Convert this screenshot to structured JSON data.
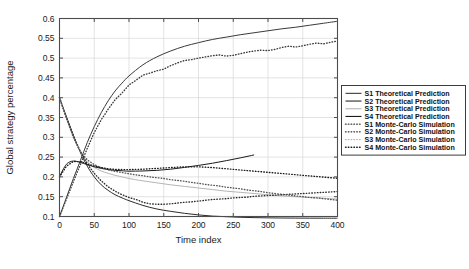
{
  "chart_data": {
    "type": "line",
    "title": "",
    "xlabel": "Time index",
    "ylabel": "Global strategy percentage",
    "xlim": [
      0,
      400
    ],
    "ylim": [
      0.1,
      0.6
    ],
    "xticks": [
      0,
      50,
      100,
      150,
      200,
      250,
      300,
      350,
      400
    ],
    "xtick_labels": [
      "0",
      "50",
      "100",
      "150",
      "200",
      "250",
      "300",
      "350",
      "400"
    ],
    "yticks": [
      0.1,
      0.15,
      0.2,
      0.25,
      0.3,
      0.35,
      0.4,
      0.45,
      0.5,
      0.55,
      0.6
    ],
    "ytick_labels": [
      "0.1",
      "0.15",
      "0.2",
      "0.25",
      "0.3",
      "0.35",
      "0.4",
      "0.45",
      "0.5",
      "0.55",
      "0.6"
    ],
    "grid": true,
    "legend_position": "right-outside",
    "colors": {
      "s1": "#3a3a3a",
      "s2": "#2b2b2b",
      "s3": "#b5b5b5",
      "s4": "#1a1a1a",
      "grid": "#d0d0d0",
      "axis": "#4d4d4d",
      "background": "#ffffff"
    },
    "series": [
      {
        "name": "S1 Theoretical Prediction",
        "style": "solid",
        "color": "#3a3a3a",
        "x": [
          0,
          10,
          20,
          30,
          40,
          50,
          60,
          70,
          80,
          90,
          100,
          120,
          140,
          160,
          180,
          200,
          220,
          240,
          260,
          280,
          300,
          320,
          340,
          360,
          380,
          400
        ],
        "y": [
          0.1,
          0.148,
          0.196,
          0.241,
          0.287,
          0.327,
          0.362,
          0.392,
          0.417,
          0.437,
          0.455,
          0.483,
          0.503,
          0.518,
          0.53,
          0.539,
          0.547,
          0.553,
          0.559,
          0.564,
          0.569,
          0.574,
          0.578,
          0.583,
          0.588,
          0.593
        ]
      },
      {
        "name": "S2 Theoretical Prediction",
        "style": "solid",
        "color": "#2b2b2b",
        "x": [
          0,
          10,
          20,
          30,
          40,
          50,
          60,
          70,
          80,
          90,
          100,
          120,
          140,
          160,
          180,
          200,
          220,
          240,
          260,
          280,
          300,
          320,
          340,
          360,
          380,
          400
        ],
        "y": [
          0.4,
          0.352,
          0.305,
          0.262,
          0.227,
          0.2,
          0.18,
          0.166,
          0.155,
          0.147,
          0.14,
          0.128,
          0.119,
          0.113,
          0.108,
          0.104,
          0.101,
          0.0995,
          0.098,
          0.0972,
          0.0966,
          0.0962,
          0.096,
          0.0958,
          0.0957,
          0.0956
        ]
      },
      {
        "name": "S3 Theoretical Prediction",
        "style": "solid",
        "color": "#b5b5b5",
        "x": [
          0,
          10,
          20,
          30,
          40,
          50,
          60,
          70,
          80,
          90,
          100,
          120,
          140,
          160,
          180,
          200,
          220,
          240,
          260,
          280,
          300,
          320,
          340,
          360,
          380,
          400
        ],
        "y": [
          0.4,
          0.347,
          0.3,
          0.262,
          0.238,
          0.224,
          0.215,
          0.209,
          0.204,
          0.2,
          0.196,
          0.19,
          0.185,
          0.18,
          0.176,
          0.172,
          0.168,
          0.164,
          0.161,
          0.158,
          0.155,
          0.152,
          0.15,
          0.148,
          0.146,
          0.144
        ]
      },
      {
        "name": "S4 Theoretical Prediction",
        "style": "solid",
        "color": "#1a1a1a",
        "x": [
          0,
          5,
          10,
          15,
          20,
          25,
          30,
          40,
          50,
          60,
          70,
          80,
          90,
          100,
          120,
          140,
          160,
          180,
          200,
          220,
          240,
          260,
          280
        ],
        "y": [
          0.2,
          0.218,
          0.232,
          0.238,
          0.24,
          0.239,
          0.2365,
          0.231,
          0.2255,
          0.2215,
          0.2185,
          0.2165,
          0.2155,
          0.2145,
          0.215,
          0.2165,
          0.2195,
          0.224,
          0.229,
          0.2345,
          0.241,
          0.248,
          0.2555
        ]
      },
      {
        "name": "S1 Monte-Carlo Simulation",
        "style": "dotted",
        "color": "#3a3a3a",
        "x": [
          0,
          10,
          20,
          30,
          40,
          50,
          60,
          70,
          80,
          90,
          100,
          110,
          120,
          130,
          140,
          150,
          160,
          170,
          180,
          190,
          200,
          210,
          220,
          230,
          240,
          250,
          260,
          270,
          280,
          290,
          300,
          310,
          320,
          330,
          340,
          350,
          360,
          370,
          380,
          390,
          400
        ],
        "y": [
          0.1,
          0.144,
          0.188,
          0.231,
          0.272,
          0.312,
          0.344,
          0.371,
          0.395,
          0.412,
          0.432,
          0.444,
          0.457,
          0.462,
          0.468,
          0.472,
          0.481,
          0.488,
          0.494,
          0.496,
          0.5,
          0.503,
          0.506,
          0.508,
          0.505,
          0.507,
          0.511,
          0.515,
          0.518,
          0.52,
          0.519,
          0.522,
          0.527,
          0.53,
          0.528,
          0.531,
          0.535,
          0.538,
          0.536,
          0.54,
          0.543
        ]
      },
      {
        "name": "S2 Monte-Carlo Simulation",
        "style": "dotted",
        "color": "#2b2b2b",
        "x": [
          0,
          10,
          20,
          30,
          40,
          50,
          60,
          70,
          80,
          90,
          100,
          110,
          120,
          130,
          140,
          150,
          160,
          170,
          180,
          190,
          200,
          210,
          220,
          230,
          240,
          250,
          260,
          270,
          280,
          290,
          300,
          310,
          320,
          330,
          340,
          350,
          360,
          370,
          380,
          390,
          400
        ],
        "y": [
          0.4,
          0.35,
          0.304,
          0.264,
          0.233,
          0.209,
          0.19,
          0.175,
          0.164,
          0.155,
          0.148,
          0.143,
          0.136,
          0.132,
          0.131,
          0.131,
          0.132,
          0.134,
          0.136,
          0.137,
          0.139,
          0.141,
          0.143,
          0.144,
          0.145,
          0.147,
          0.148,
          0.149,
          0.151,
          0.152,
          0.153,
          0.154,
          0.155,
          0.156,
          0.157,
          0.158,
          0.159,
          0.16,
          0.161,
          0.162,
          0.163
        ]
      },
      {
        "name": "S3 Monte-Carlo Simulation",
        "style": "dotted",
        "color": "#555555",
        "x": [
          0,
          10,
          20,
          30,
          40,
          50,
          60,
          70,
          80,
          90,
          100,
          110,
          120,
          130,
          140,
          150,
          160,
          170,
          180,
          190,
          200,
          210,
          220,
          230,
          240,
          250,
          260,
          270,
          280,
          290,
          300,
          310,
          320,
          330,
          340,
          350,
          360,
          370,
          380,
          390,
          400
        ],
        "y": [
          0.4,
          0.348,
          0.3,
          0.264,
          0.243,
          0.231,
          0.223,
          0.218,
          0.214,
          0.211,
          0.208,
          0.205,
          0.203,
          0.2,
          0.198,
          0.196,
          0.193,
          0.191,
          0.189,
          0.186,
          0.184,
          0.181,
          0.179,
          0.177,
          0.174,
          0.172,
          0.17,
          0.167,
          0.165,
          0.163,
          0.16,
          0.158,
          0.156,
          0.154,
          0.152,
          0.15,
          0.148,
          0.147,
          0.145,
          0.143,
          0.141
        ]
      },
      {
        "name": "S4 Monte-Carlo Simulation",
        "style": "dotted",
        "color": "#1a1a1a",
        "x": [
          0,
          10,
          20,
          30,
          40,
          50,
          60,
          70,
          80,
          90,
          100,
          110,
          120,
          130,
          140,
          150,
          160,
          170,
          180,
          190,
          200,
          210,
          220,
          230,
          240,
          250,
          260,
          270,
          280,
          290,
          300,
          310,
          320,
          330,
          340,
          350,
          360,
          370,
          380,
          390,
          400
        ],
        "y": [
          0.2,
          0.227,
          0.239,
          0.2385,
          0.233,
          0.2275,
          0.2235,
          0.2205,
          0.219,
          0.2185,
          0.2185,
          0.219,
          0.2195,
          0.2205,
          0.2215,
          0.2225,
          0.2235,
          0.2245,
          0.2255,
          0.2255,
          0.2255,
          0.2245,
          0.2235,
          0.222,
          0.2205,
          0.219,
          0.2175,
          0.216,
          0.2145,
          0.213,
          0.2115,
          0.21,
          0.2085,
          0.207,
          0.2055,
          0.204,
          0.2025,
          0.201,
          0.1995,
          0.198,
          0.1965
        ]
      }
    ],
    "legend_entries": [
      {
        "label": "S1 Theoretical Prediction",
        "style": "solid",
        "color": "#3a3a3a"
      },
      {
        "label": "S2 Theoretical Prediction",
        "style": "solid",
        "color": "#2b2b2b"
      },
      {
        "label": "S3 Theoretical Prediction",
        "style": "solid",
        "color": "#b5b5b5"
      },
      {
        "label": "S4 Theoretical Prediction",
        "style": "solid",
        "color": "#1a1a1a"
      },
      {
        "label": "S1 Monte-Carlo Simulation",
        "style": "dotted",
        "color": "#3a3a3a"
      },
      {
        "label": "S2 Monte-Carlo Simulation",
        "style": "dotted",
        "color": "#2b2b2b"
      },
      {
        "label": "S3 Monte-Carlo Simulation",
        "style": "dotted",
        "color": "#b5b5b5"
      },
      {
        "label": "S4 Monte-Carlo Simulation",
        "style": "dotted",
        "color": "#1a1a1a"
      }
    ]
  }
}
